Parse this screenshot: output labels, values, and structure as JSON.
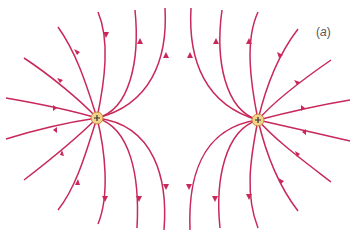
{
  "figure": {
    "label": "(a)",
    "label_open": "(",
    "label_letter": "a",
    "label_close": ")",
    "line_color": "#c8285a",
    "charge_fill": "#f3d28c",
    "charge_stroke": "#c8893a",
    "charges": [
      {
        "id": "left",
        "sign": "+",
        "x": 97,
        "y": 118
      },
      {
        "id": "right",
        "sign": "+",
        "x": 258,
        "y": 120
      }
    ]
  }
}
